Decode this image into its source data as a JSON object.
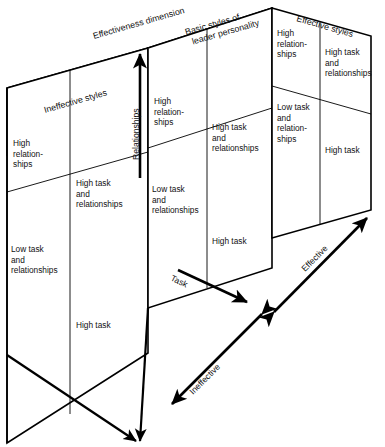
{
  "figure": {
    "background_color": "#ffffff",
    "line_color": "#000000",
    "shade_color": "#b3b3b3"
  },
  "axes": [
    {
      "key": "relationships",
      "label": "Relationships",
      "orientation": "vertical-up",
      "arrow": "single"
    },
    {
      "key": "task",
      "label": "Task",
      "orientation": "diagonal-down-right",
      "arrow": "single"
    },
    {
      "key": "effective",
      "label": "Effective",
      "orientation": "diagonal-up-right",
      "arrow": "double"
    },
    {
      "key": "ineffective",
      "label": "Ineffective",
      "orientation": "diagonal-down-left",
      "arrow": "double"
    }
  ],
  "annotations": {
    "effectiveness_dimension": "Effectiveness dimension",
    "basic_styles": "Basic styles of\nleader personality",
    "basic_styles_line1": "Basic styles of",
    "basic_styles_line2": "leader personality"
  },
  "planes": [
    {
      "key": "ineffective_styles",
      "label": "Ineffective styles",
      "position": "front-left",
      "cells": [
        {
          "quadrant": "top-left",
          "lines": [
            "High",
            "relation-",
            "ships"
          ]
        },
        {
          "quadrant": "top-right",
          "lines": [
            "High task",
            "and",
            "relationships"
          ]
        },
        {
          "quadrant": "bottom-left",
          "lines": [
            "Low task",
            "and",
            "relationships"
          ]
        },
        {
          "quadrant": "bottom-right",
          "lines": [
            "High task"
          ]
        }
      ]
    },
    {
      "key": "basic_styles",
      "label": "Basic styles of leader personality",
      "position": "middle",
      "cells": [
        {
          "quadrant": "top-left",
          "lines": [
            "High",
            "relation-",
            "ships"
          ]
        },
        {
          "quadrant": "top-right",
          "lines": [
            "High task",
            "and",
            "relationships"
          ]
        },
        {
          "quadrant": "bottom-left",
          "lines": [
            "Low task",
            "and",
            "relationships"
          ]
        },
        {
          "quadrant": "bottom-right",
          "lines": [
            "High task"
          ]
        }
      ]
    },
    {
      "key": "effective_styles",
      "label": "Effective styles",
      "position": "back-right",
      "cells": [
        {
          "quadrant": "top-left",
          "lines": [
            "High",
            "relation-",
            "ships"
          ]
        },
        {
          "quadrant": "top-right",
          "lines": [
            "High task",
            "and",
            "relationships"
          ]
        },
        {
          "quadrant": "bottom-left",
          "lines": [
            "Low task",
            "and",
            "relation-",
            "ships"
          ]
        },
        {
          "quadrant": "bottom-right",
          "lines": [
            "High task"
          ]
        }
      ]
    }
  ]
}
